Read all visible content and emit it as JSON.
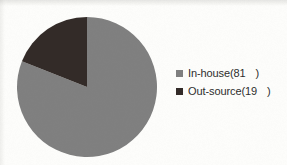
{
  "chart_data": {
    "type": "pie",
    "title": "",
    "categories": [
      "In-house",
      "Out-source"
    ],
    "values": [
      81,
      19
    ],
    "unit_suffix_missing_glyph": true,
    "labels": [
      "In-house(81  )",
      "Out-source(19  )"
    ],
    "legend_position": "right",
    "start_angle_deg": 0,
    "direction": "counterclockwise",
    "colors": [
      "#808080",
      "#332b28"
    ],
    "grid": false
  },
  "chart": {
    "slices": [
      {
        "name": "In-house",
        "value": 81,
        "color": "#808080"
      },
      {
        "name": "Out-source",
        "value": 19,
        "color": "#332b28"
      }
    ]
  },
  "legend": {
    "items": [
      {
        "swatch_color": "#808080",
        "name_text": "In-house(81",
        "close_text": ")"
      },
      {
        "swatch_color": "#332b28",
        "name_text": "Out-source(19",
        "close_text": ")"
      }
    ]
  },
  "colors": {
    "background": "#fdfdfb",
    "in_house": "#808080",
    "out_source": "#332b28",
    "text": "#2d2d2d"
  }
}
